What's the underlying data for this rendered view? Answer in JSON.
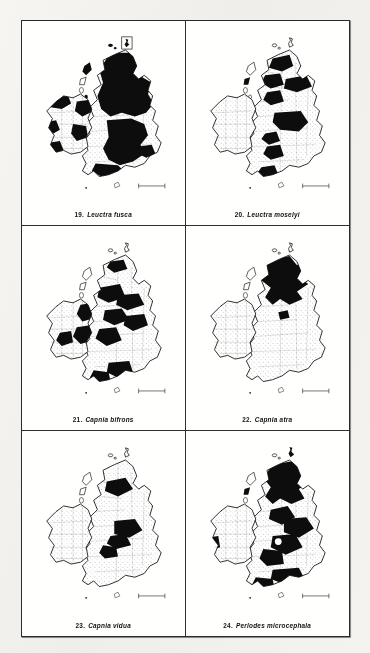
{
  "plate": {
    "title": "Distribution maps of British stoneflies (Plecoptera)",
    "region": "British Isles",
    "layout": {
      "columns": 2,
      "rows": 3,
      "frame": "ruled-border"
    },
    "ink_color": "#111111",
    "paper_color": "#fbfaf8",
    "shaded_fill_meaning": "recorded / present vice-counties (solid black)",
    "unshaded_fill_meaning": "not recorded (stippled outline)",
    "inset_label": "Shetland inset"
  },
  "maps": [
    {
      "number": "19.",
      "species": "Leuctra fusca",
      "caption": "19. Leuctra fusca",
      "coverage": "widespread - most of Scotland, northern and western England, Wales, scattered Ireland"
    },
    {
      "number": "20.",
      "species": "Leuctra moselyi",
      "caption": "20. Leuctra moselyi",
      "coverage": "northern Scotland, northern England, Wales, south-west England; absent Ireland"
    },
    {
      "number": "21.",
      "species": "Capnia bifrons",
      "caption": "21. Capnia bifrons",
      "coverage": "scattered Scotland, northern England, Wales, southern England, eastern Ireland"
    },
    {
      "number": "22.",
      "species": "Capnia atra",
      "caption": "22. Capnia atra",
      "coverage": "Scottish Highlands only"
    },
    {
      "number": "23.",
      "species": "Capnia vidua",
      "caption": "23. Capnia vidua",
      "coverage": "central Scotland and northern England"
    },
    {
      "number": "24.",
      "species": "Perlodes microcephala",
      "caption": "24. Perlodes microcephala",
      "coverage": "widespread Scotland, northern England, Wales, south-west England"
    }
  ]
}
